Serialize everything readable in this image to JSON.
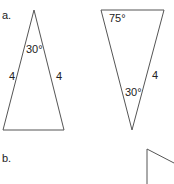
{
  "parts": {
    "a": {
      "label": "a.",
      "triangle1": {
        "apex_angle": "30°",
        "left_side": "4",
        "right_side": "4"
      },
      "triangle2": {
        "top_left_angle": "75°",
        "right_side": "4",
        "bottom_angle": "30°"
      }
    },
    "b": {
      "label": "b."
    }
  },
  "colors": {
    "stroke": "#555555",
    "text": "#222222"
  }
}
